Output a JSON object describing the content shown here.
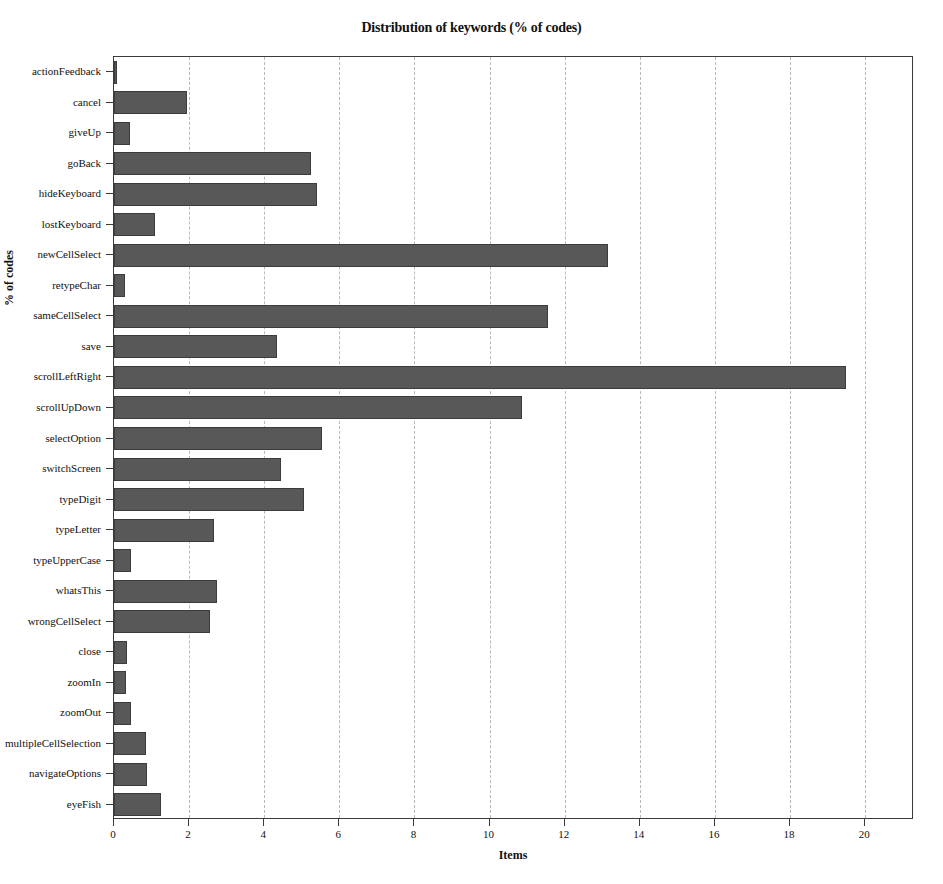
{
  "figure": {
    "width": 943,
    "height": 884,
    "background": "#ffffff"
  },
  "style": {
    "bar_color": "#585858",
    "bar_edge_color": "#3c3c3c",
    "axis_color": "#3b3b3b",
    "grid_color": "#b9b9b9"
  },
  "chart_data": {
    "type": "bar",
    "orientation": "horizontal",
    "title": "Distribution of keywords (% of codes)",
    "xlabel": "Items",
    "ylabel": "% of codes",
    "xlim": [
      0,
      21.3
    ],
    "xticks": [
      0,
      2,
      4,
      6,
      8,
      10,
      12,
      14,
      16,
      18,
      20
    ],
    "xticklabels": [
      "0",
      "2",
      "4",
      "6",
      "8",
      "10",
      "12",
      "14",
      "16",
      "18",
      "20"
    ],
    "grid": "x-axis dashed vertical gridlines only",
    "legend": "none",
    "categories": [
      "actionFeedback",
      "cancel",
      "giveUp",
      "goBack",
      "hideKeyboard",
      "lostKeyboard",
      "newCellSelect",
      "retypeChar",
      "sameCellSelect",
      "save",
      "scrollLeftRight",
      "scrollUpDown",
      "selectOption",
      "switchScreen",
      "typeDigit",
      "typeLetter",
      "typeUpperCase",
      "whatsThis",
      "wrongCellSelect",
      "close",
      "zoomIn",
      "zoomOut",
      "multipleCellSelection",
      "navigateOptions",
      "eyeFish"
    ],
    "values": [
      0.08,
      1.95,
      0.43,
      5.25,
      5.4,
      1.1,
      13.15,
      0.28,
      11.55,
      4.35,
      19.5,
      10.85,
      5.55,
      4.45,
      5.05,
      2.65,
      0.45,
      2.75,
      2.55,
      0.35,
      0.32,
      0.45,
      0.85,
      0.88,
      1.25
    ]
  }
}
